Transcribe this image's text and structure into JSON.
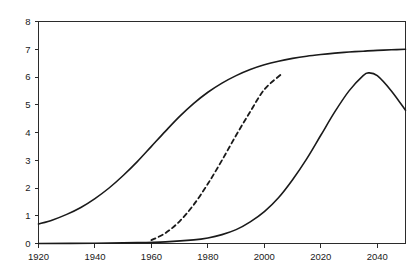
{
  "chart_data": {
    "type": "line",
    "title": "",
    "subtitle": "",
    "xlabel": "",
    "ylabel": "",
    "xlim": [
      1920,
      2050
    ],
    "ylim": [
      0,
      8
    ],
    "grid": false,
    "legend": "none",
    "xticks": [
      1920,
      1940,
      1960,
      1980,
      2000,
      2020,
      2040
    ],
    "xtick_labels": [
      "1920",
      "1940",
      "1960",
      "1980",
      "2000",
      "2020",
      "2040"
    ],
    "yticks": [
      0,
      1,
      2,
      3,
      4,
      5,
      6,
      7,
      8
    ],
    "ytick_labels": [
      "0",
      "1",
      "2",
      "3",
      "4",
      "5",
      "6",
      "7",
      "8"
    ],
    "line_color": "#1a1a1a",
    "axis_color": "#2b2b2b",
    "background_color": "#ffffff",
    "series": [
      {
        "name": "series-1-solid-saturating",
        "style": "solid",
        "x": [
          1920,
          1925,
          1930,
          1935,
          1940,
          1945,
          1950,
          1955,
          1960,
          1965,
          1970,
          1975,
          1980,
          1985,
          1990,
          1995,
          2000,
          2005,
          2010,
          2015,
          2020,
          2025,
          2030,
          2035,
          2040,
          2045,
          2050
        ],
        "y": [
          0.7,
          0.85,
          1.05,
          1.3,
          1.62,
          2.0,
          2.45,
          2.95,
          3.5,
          4.05,
          4.58,
          5.05,
          5.45,
          5.78,
          6.05,
          6.27,
          6.44,
          6.57,
          6.67,
          6.75,
          6.81,
          6.86,
          6.9,
          6.93,
          6.96,
          6.98,
          7.0
        ]
      },
      {
        "name": "series-2-dashed-rising",
        "style": "dashed",
        "x": [
          1960,
          1965,
          1970,
          1975,
          1980,
          1985,
          1990,
          1995,
          2000,
          2006
        ],
        "y": [
          0.12,
          0.38,
          0.8,
          1.4,
          2.15,
          3.0,
          3.9,
          4.75,
          5.55,
          6.1
        ]
      },
      {
        "name": "series-3-solid-peaking",
        "style": "solid",
        "x": [
          1920,
          1940,
          1955,
          1965,
          1975,
          1980,
          1985,
          1990,
          1995,
          2000,
          2005,
          2010,
          2015,
          2020,
          2025,
          2030,
          2035,
          2037,
          2040,
          2045,
          2050
        ],
        "y": [
          0.0,
          0.01,
          0.03,
          0.06,
          0.13,
          0.2,
          0.32,
          0.5,
          0.78,
          1.15,
          1.65,
          2.3,
          3.05,
          3.9,
          4.75,
          5.5,
          6.05,
          6.15,
          6.05,
          5.5,
          4.8
        ]
      }
    ]
  }
}
